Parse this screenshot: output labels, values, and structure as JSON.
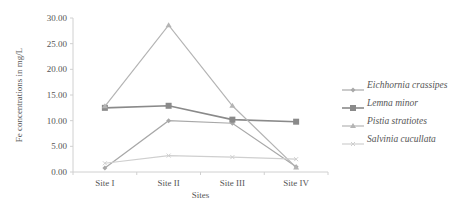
{
  "chart_data": {
    "type": "line",
    "title": "",
    "xlabel": "Sites",
    "ylabel": "Fe concentrations in mg/L",
    "categories": [
      "Site I",
      "Site II",
      "Site III",
      "Site IV"
    ],
    "ylim": [
      0,
      30
    ],
    "yticks": [
      "0.00",
      "5.00",
      "10.00",
      "15.00",
      "20.00",
      "25.00",
      "30.00"
    ],
    "grid": false,
    "legend_position": "right",
    "series": [
      {
        "name": "Eichhornia crassipes",
        "marker": "diamond",
        "color": "#a8a8a8",
        "values": [
          0.8,
          10.0,
          9.5,
          1.0
        ]
      },
      {
        "name": "Lemna minor",
        "marker": "square",
        "color": "#8a8a8a",
        "values": [
          12.5,
          12.9,
          10.2,
          9.8
        ]
      },
      {
        "name": "Pistia stratiotes",
        "marker": "triangle",
        "color": "#b4b4b4",
        "values": [
          12.8,
          28.6,
          12.9,
          0.9
        ]
      },
      {
        "name": "Salvinia cucullata",
        "marker": "x",
        "color": "#cfcfcf",
        "values": [
          1.7,
          3.2,
          2.9,
          2.5
        ]
      }
    ]
  }
}
